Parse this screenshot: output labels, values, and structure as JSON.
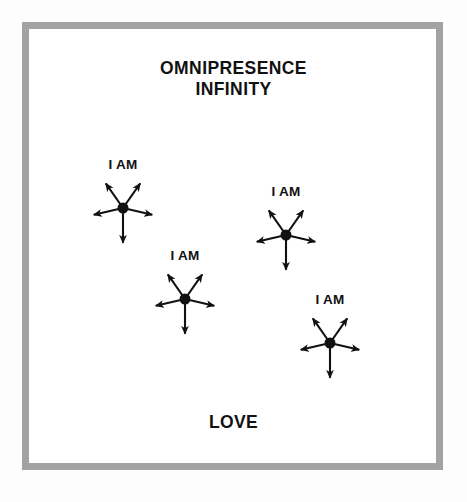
{
  "page": {
    "background_color": "#fdfdfd",
    "inner_background_color": "#ffffff",
    "frame_color": "#a3a3a3",
    "ink_color": "#111111"
  },
  "heading": {
    "line1": "OMNIPRESENCE",
    "line2": "INFINITY"
  },
  "footer": {
    "word": "LOVE"
  },
  "chart_data": {
    "type": "diagram",
    "title": "OMNIPRESENCE INFINITY",
    "subtitle": "LOVE",
    "node_label": "I AM",
    "arrow_directions_deg": [
      125,
      55,
      193,
      347,
      270
    ],
    "nodes": [
      {
        "id": "node-1",
        "label": "I AM",
        "cx": 123,
        "cy": 208,
        "label_x": 123,
        "label_y": 157,
        "radius": 5.5,
        "arm_length": 30
      },
      {
        "id": "node-2",
        "label": "I AM",
        "cx": 286,
        "cy": 235,
        "label_x": 286,
        "label_y": 184,
        "radius": 5.5,
        "arm_length": 30
      },
      {
        "id": "node-3",
        "label": "I AM",
        "cx": 185,
        "cy": 299,
        "label_x": 185,
        "label_y": 248,
        "radius": 5.5,
        "arm_length": 30
      },
      {
        "id": "node-4",
        "label": "I AM",
        "cx": 330,
        "cy": 343,
        "label_x": 330,
        "label_y": 292,
        "radius": 5.5,
        "arm_length": 30
      }
    ],
    "legend": [],
    "grid": false
  }
}
